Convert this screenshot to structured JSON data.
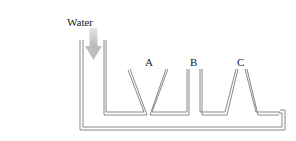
{
  "diagram": {
    "type": "communicating-vessels",
    "inlet_label": "Water",
    "vessel_labels": [
      "A",
      "B",
      "C"
    ],
    "colors": {
      "wall": "#7a7a7a",
      "arrow": "#c8c8c8",
      "text": "#1a1a1a"
    }
  }
}
